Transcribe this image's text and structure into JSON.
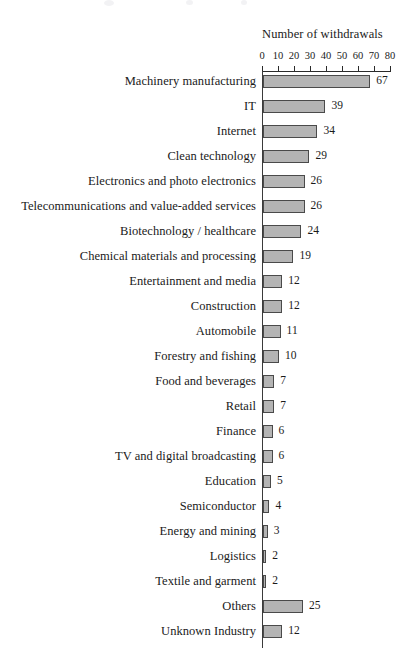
{
  "chart_data": {
    "type": "bar",
    "orientation": "horizontal",
    "title": "",
    "xlabel": "Number of withdrawals",
    "ylabel": "",
    "xlim": [
      0,
      80
    ],
    "xticks": [
      0,
      10,
      20,
      30,
      40,
      50,
      60,
      70,
      80
    ],
    "grid": false,
    "legend": null,
    "value_labels": true,
    "categories": [
      "Machinery manufacturing",
      "IT",
      "Internet",
      "Clean technology",
      "Electronics and photo electronics",
      "Telecommunications and value-added services",
      "Biotechnology / healthcare",
      "Chemical materials and processing",
      "Entertainment and media",
      "Construction",
      "Automobile",
      "Forestry and fishing",
      "Food and beverages",
      "Retail",
      "Finance",
      "TV and digital broadcasting",
      "Education",
      "Semiconductor",
      "Energy and mining",
      "Logistics",
      "Textile and garment",
      "Others",
      "Unknown Industry"
    ],
    "values": [
      67,
      39,
      34,
      29,
      26,
      26,
      24,
      19,
      12,
      12,
      11,
      10,
      7,
      7,
      6,
      6,
      5,
      4,
      3,
      2,
      2,
      25,
      12
    ],
    "bar_fill_color": "#b4b4b4",
    "bar_border_color": "#4a4a4a",
    "axis_color": "#2a2a2a",
    "text_color": "#1a1a1a"
  },
  "axis": {
    "title": "Number of withdrawals",
    "tick_labels": [
      "0",
      "10",
      "20",
      "30",
      "40",
      "50",
      "60",
      "70",
      "80"
    ]
  },
  "rows": [
    {
      "label": "Machinery manufacturing",
      "value": "67"
    },
    {
      "label": "IT",
      "value": "39"
    },
    {
      "label": "Internet",
      "value": "34"
    },
    {
      "label": "Clean technology",
      "value": "29"
    },
    {
      "label": "Electronics and photo electronics",
      "value": "26"
    },
    {
      "label": "Telecommunications and value-added services",
      "value": "26"
    },
    {
      "label": "Biotechnology / healthcare",
      "value": "24"
    },
    {
      "label": "Chemical materials and processing",
      "value": "19"
    },
    {
      "label": "Entertainment and media",
      "value": "12"
    },
    {
      "label": "Construction",
      "value": "12"
    },
    {
      "label": "Automobile",
      "value": "11"
    },
    {
      "label": "Forestry and fishing",
      "value": "10"
    },
    {
      "label": "Food and beverages",
      "value": "7"
    },
    {
      "label": "Retail",
      "value": "7"
    },
    {
      "label": "Finance",
      "value": "6"
    },
    {
      "label": "TV and digital broadcasting",
      "value": "6"
    },
    {
      "label": "Education",
      "value": "5"
    },
    {
      "label": "Semiconductor",
      "value": "4"
    },
    {
      "label": "Energy and mining",
      "value": "3"
    },
    {
      "label": "Logistics",
      "value": "2"
    },
    {
      "label": "Textile and garment",
      "value": "2"
    },
    {
      "label": "Others",
      "value": "25"
    },
    {
      "label": "Unknown Industry",
      "value": "12"
    }
  ]
}
